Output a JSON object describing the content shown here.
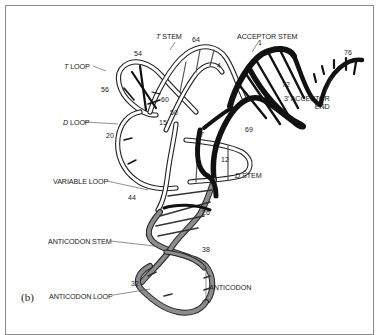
{
  "figure": {
    "panel_label": "(b)"
  },
  "labels": {
    "t_stem_letter": "T",
    "t_stem_rest": " STEM",
    "acceptor_stem": "ACCEPTOR STEM",
    "t_loop_letter": "T",
    "t_loop_rest": " LOOP",
    "d_loop_letter": "D",
    "d_loop_rest": " LOOP",
    "acceptor_end_line1": "3' ACCEPTOR",
    "acceptor_end_line2": "END",
    "d_stem_letter": "D",
    "d_stem_rest": " STEM",
    "variable_loop": "VARIABLE LOOP",
    "anticodon_stem": "ANTICODON STEM",
    "anticodon_loop": "ANTICODON LOOP",
    "anticodon": "ANTICODON"
  },
  "numbers": {
    "n1": "1",
    "n4": "4",
    "n7": "7",
    "n12": "12",
    "n15": "15",
    "n20": "20",
    "n26": "26",
    "n32": "32",
    "n38": "38",
    "n44": "44",
    "n50": "50",
    "n54": "54",
    "n56": "56",
    "n60": "60",
    "n64": "64",
    "n69": "69",
    "n72": "72",
    "n76": "76"
  },
  "colors": {
    "acceptor_strand": "#111111",
    "t_arm_strand": "#ffffff",
    "anticodon_strand": "#8c8c8c",
    "outline": "#222222",
    "frame": "#8a8a8a"
  }
}
